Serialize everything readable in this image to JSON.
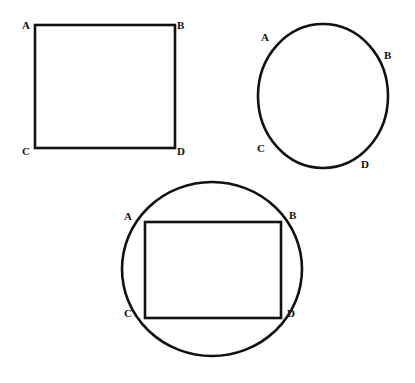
{
  "document": {
    "title": "Geometry figures: rectangle, circle, and rectangle inscribed in circle",
    "background_color": "#ffffff",
    "stroke_color": "#111111",
    "label_color": "#111111",
    "width": 415,
    "height": 383
  },
  "figures": [
    {
      "id": "figure-1",
      "name": "rectangle",
      "shape": "rectangle",
      "stroke_width": 2.6,
      "geometry": {
        "x": 35,
        "y": 25,
        "width": 140,
        "height": 123
      },
      "labels": [
        {
          "text": "A",
          "vertex": "top-left",
          "x": 22,
          "y": 20
        },
        {
          "text": "B",
          "vertex": "top-right",
          "x": 177,
          "y": 20
        },
        {
          "text": "C",
          "vertex": "bottom-left",
          "x": 22,
          "y": 146
        },
        {
          "text": "D",
          "vertex": "bottom-right",
          "x": 177,
          "y": 146
        }
      ]
    },
    {
      "id": "figure-2",
      "name": "circle",
      "shape": "ellipse",
      "stroke_width": 2.6,
      "geometry": {
        "cx": 323,
        "cy": 96,
        "rx": 65,
        "ry": 72
      },
      "labels": [
        {
          "text": "A",
          "vertex": "upper-left",
          "x": 261,
          "y": 32
        },
        {
          "text": "B",
          "vertex": "upper-right",
          "x": 384,
          "y": 50
        },
        {
          "text": "C",
          "vertex": "lower-left",
          "x": 257,
          "y": 143
        },
        {
          "text": "D",
          "vertex": "lower-right",
          "x": 361,
          "y": 159
        }
      ]
    },
    {
      "id": "figure-3",
      "name": "rectangle-inscribed-in-circle",
      "shape": "circle-with-inscribed-rectangle",
      "stroke_width": 2.6,
      "geometry": {
        "circle": {
          "cx": 212,
          "cy": 269,
          "rx": 90,
          "ry": 87
        },
        "rectangle": {
          "x": 145,
          "y": 222,
          "width": 136,
          "height": 96
        }
      },
      "labels": [
        {
          "text": "A",
          "vertex": "top-left",
          "x": 124,
          "y": 211
        },
        {
          "text": "B",
          "vertex": "top-right",
          "x": 289,
          "y": 210
        },
        {
          "text": "C",
          "vertex": "bottom-left",
          "x": 124,
          "y": 308
        },
        {
          "text": "D",
          "vertex": "bottom-right",
          "x": 287,
          "y": 308
        }
      ]
    }
  ]
}
